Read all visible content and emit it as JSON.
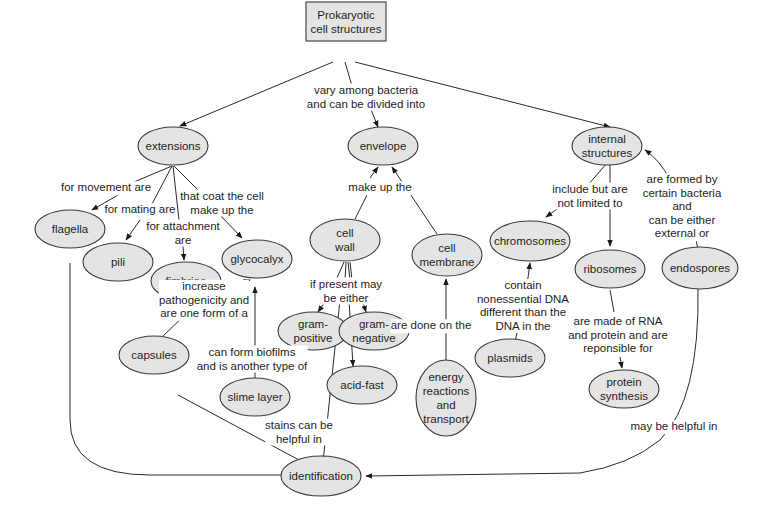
{
  "diagram": {
    "type": "concept-map",
    "root": {
      "id": "root",
      "label": "Prokaryotic\ncell structures"
    },
    "nodes": [
      {
        "id": "extensions",
        "label": "extensions"
      },
      {
        "id": "envelope",
        "label": "envelope"
      },
      {
        "id": "internal",
        "label": "internal\nstructures"
      },
      {
        "id": "flagella",
        "label": "flagella"
      },
      {
        "id": "pili",
        "label": "pili"
      },
      {
        "id": "fimbriae",
        "label": "fimbriae"
      },
      {
        "id": "glycocalyx",
        "label": "glycocalyx"
      },
      {
        "id": "cellwall",
        "label": "cell\nwall"
      },
      {
        "id": "cellmembrane",
        "label": "cell\nmembrane"
      },
      {
        "id": "grampos",
        "label": "gram-\npositive"
      },
      {
        "id": "gramneg",
        "label": "gram-\nnegative"
      },
      {
        "id": "acidfast",
        "label": "acid-fast"
      },
      {
        "id": "capsules",
        "label": "capsules"
      },
      {
        "id": "slime",
        "label": "slime layer"
      },
      {
        "id": "energy",
        "label": "energy\nreactions\nand\ntransport"
      },
      {
        "id": "chromosomes",
        "label": "chromosomes"
      },
      {
        "id": "ribosomes",
        "label": "ribosomes"
      },
      {
        "id": "endospores",
        "label": "endospores"
      },
      {
        "id": "plasmids",
        "label": "plasmids"
      },
      {
        "id": "protein",
        "label": "protein\nsynthesis"
      },
      {
        "id": "identification",
        "label": "identification"
      }
    ],
    "edge_labels": {
      "root_children": "vary among bacteria\nand can be divided into",
      "movement": "for movement are",
      "mating": "for mating are",
      "attachment": "for attachment\nare",
      "coat": "that coat the cell\nmake up the",
      "make_up": "make up the",
      "if_present": "if present may\nbe either",
      "include": "include but are\nnot limited to",
      "formed_by": "are formed by\ncertain bacteria and\ncan be either\nexternal or",
      "increase": "increase\npathogenicity and\nare one form of a",
      "biofilms": "can form biofilms\nand is another type of",
      "done_on": "are done on the",
      "contain": "contain\nnonessential DNA\ndifferent than the\nDNA in the",
      "made_of": "are made of RNA\nand protein and are\nreponsible for",
      "stains": "stains can be\nhelpful in",
      "may_help": "may be helpful in"
    }
  }
}
